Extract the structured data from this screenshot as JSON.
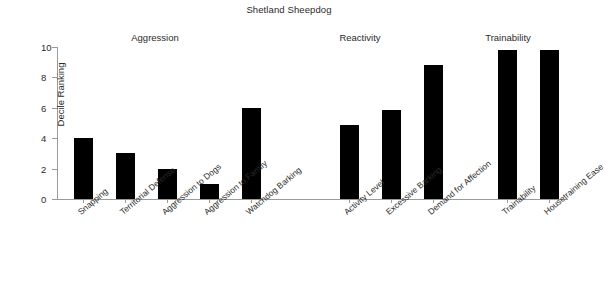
{
  "chart_data": {
    "type": "bar",
    "title": "Shetland Sheepdog",
    "xlabel": "",
    "ylabel": "Decile Ranking",
    "ylim": [
      0,
      10
    ],
    "yticks": [
      0,
      2,
      4,
      6,
      8,
      10
    ],
    "grid": false,
    "legend": "none",
    "bar_color": "#000000",
    "axis_color": "#9a9a9a",
    "categories": [
      "Snapping",
      "Territorial Defense",
      "Aggression to Dogs",
      "Aggression to Family",
      "Watchdog Barking",
      "Activity Level",
      "Excessive Barking",
      "Demand for Affection",
      "Trainability",
      "Housetraining Ease"
    ],
    "values": [
      4.0,
      3.0,
      2.0,
      1.0,
      6.0,
      4.85,
      5.85,
      8.8,
      9.8,
      9.8
    ],
    "groups": [
      {
        "label": "Aggression",
        "categories": [
          "Snapping",
          "Territorial Defense",
          "Aggression to Dogs",
          "Aggression to Family",
          "Watchdog Barking"
        ]
      },
      {
        "label": "Reactivity",
        "categories": [
          "Activity Level",
          "Excessive Barking",
          "Demand for Affection"
        ]
      },
      {
        "label": "Trainability",
        "categories": [
          "Trainability",
          "Housetraining Ease"
        ]
      }
    ]
  },
  "chart": {
    "title": "Shetland Sheepdog",
    "y_axis_title": "Decile Ranking",
    "group_labels": {
      "aggression": "Aggression",
      "reactivity": "Reactivity",
      "trainability": "Trainability"
    }
  }
}
